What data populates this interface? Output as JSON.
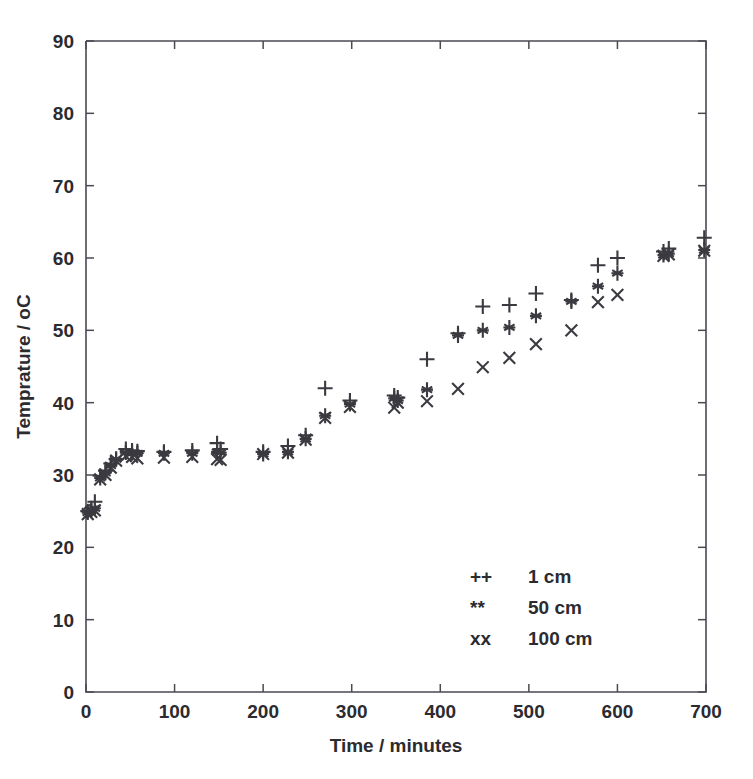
{
  "chart_data": {
    "type": "scatter",
    "title": "",
    "xlabel": "Time /   minutes",
    "ylabel": "Temprature /   oC",
    "xlim": [
      0,
      700
    ],
    "ylim": [
      0,
      90
    ],
    "xticks": [
      0,
      100,
      200,
      300,
      400,
      500,
      600,
      700
    ],
    "yticks": [
      0,
      10,
      20,
      30,
      40,
      50,
      60,
      70,
      80,
      90
    ],
    "grid": false,
    "legend_position": "lower-right-inside",
    "marker_color": "#3a3a40",
    "series": [
      {
        "name": "1 cm",
        "legend_symbol": "++",
        "marker": "plus",
        "points": [
          [
            2,
            25.0
          ],
          [
            6,
            25.4
          ],
          [
            10,
            26.3
          ],
          [
            16,
            29.9
          ],
          [
            22,
            30.6
          ],
          [
            28,
            31.6
          ],
          [
            34,
            32.2
          ],
          [
            45,
            33.6
          ],
          [
            52,
            33.4
          ],
          [
            58,
            33.3
          ],
          [
            88,
            33.2
          ],
          [
            120,
            33.4
          ],
          [
            148,
            34.4
          ],
          [
            152,
            33.6
          ],
          [
            200,
            33.2
          ],
          [
            228,
            34.0
          ],
          [
            248,
            35.5
          ],
          [
            270,
            42.0
          ],
          [
            298,
            40.3
          ],
          [
            348,
            41.0
          ],
          [
            352,
            40.7
          ],
          [
            385,
            46.0
          ],
          [
            420,
            49.6
          ],
          [
            448,
            53.3
          ],
          [
            478,
            53.5
          ],
          [
            508,
            55.1
          ],
          [
            548,
            54.2
          ],
          [
            578,
            59.0
          ],
          [
            600,
            60.0
          ],
          [
            652,
            60.9
          ],
          [
            658,
            61.3
          ],
          [
            698,
            62.8
          ]
        ]
      },
      {
        "name": "50 cm",
        "legend_symbol": "**",
        "marker": "asterisk",
        "points": [
          [
            2,
            24.8
          ],
          [
            6,
            25.1
          ],
          [
            10,
            25.4
          ],
          [
            16,
            29.6
          ],
          [
            22,
            30.3
          ],
          [
            28,
            31.3
          ],
          [
            34,
            32.2
          ],
          [
            45,
            33.1
          ],
          [
            52,
            33.0
          ],
          [
            58,
            33.0
          ],
          [
            88,
            33.0
          ],
          [
            120,
            33.0
          ],
          [
            148,
            33.2
          ],
          [
            152,
            33.1
          ],
          [
            200,
            32.9
          ],
          [
            228,
            33.2
          ],
          [
            248,
            35.0
          ],
          [
            270,
            38.2
          ],
          [
            298,
            39.8
          ],
          [
            348,
            40.6
          ],
          [
            352,
            40.3
          ],
          [
            385,
            41.8
          ],
          [
            420,
            49.3
          ],
          [
            448,
            50.0
          ],
          [
            478,
            50.4
          ],
          [
            508,
            52.0
          ],
          [
            548,
            54.0
          ],
          [
            578,
            56.1
          ],
          [
            600,
            57.9
          ],
          [
            652,
            60.4
          ],
          [
            658,
            60.6
          ],
          [
            698,
            61.1
          ]
        ]
      },
      {
        "name": "100 cm",
        "legend_symbol": "xx",
        "marker": "cross",
        "points": [
          [
            2,
            24.6
          ],
          [
            6,
            24.9
          ],
          [
            10,
            25.1
          ],
          [
            16,
            29.4
          ],
          [
            22,
            30.0
          ],
          [
            28,
            31.0
          ],
          [
            34,
            32.0
          ],
          [
            45,
            32.6
          ],
          [
            52,
            32.5
          ],
          [
            58,
            32.3
          ],
          [
            88,
            32.4
          ],
          [
            120,
            32.5
          ],
          [
            148,
            32.2
          ],
          [
            152,
            32.1
          ],
          [
            200,
            32.9
          ],
          [
            228,
            33.1
          ],
          [
            248,
            34.9
          ],
          [
            270,
            37.9
          ],
          [
            298,
            39.4
          ],
          [
            348,
            39.3
          ],
          [
            352,
            40.0
          ],
          [
            385,
            40.2
          ],
          [
            420,
            41.9
          ],
          [
            448,
            44.9
          ],
          [
            478,
            46.2
          ],
          [
            508,
            48.1
          ],
          [
            548,
            50.0
          ],
          [
            578,
            53.9
          ],
          [
            600,
            54.9
          ],
          [
            652,
            60.3
          ],
          [
            658,
            60.5
          ],
          [
            698,
            61.0
          ]
        ]
      }
    ]
  },
  "axes": {
    "x_tick_labels": [
      "0",
      "100",
      "200",
      "300",
      "400",
      "500",
      "600",
      "700"
    ],
    "y_tick_labels": [
      "0",
      "10",
      "20",
      "30",
      "40",
      "50",
      "60",
      "70",
      "80",
      "90"
    ],
    "x_axis_title": "Time /   minutes",
    "y_axis_title": "Temprature /   oC"
  },
  "legend": {
    "entries": [
      {
        "symbol": "++",
        "label": "1 cm"
      },
      {
        "symbol": "**",
        "label": "50 cm"
      },
      {
        "symbol": "xx",
        "label": "100 cm"
      }
    ]
  }
}
